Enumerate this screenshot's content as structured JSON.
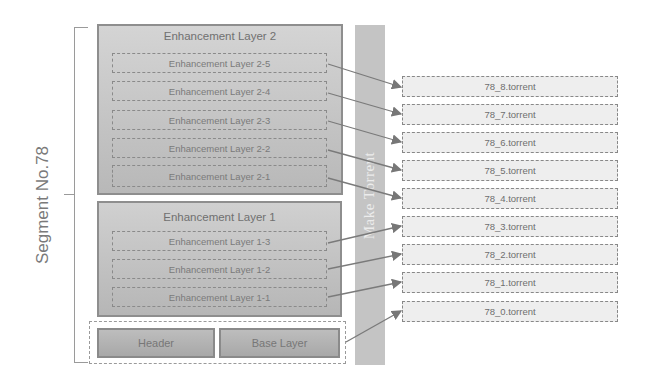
{
  "segment_label": "Segment No.78",
  "make_torrent_label": "Make Torrent",
  "enhancement_layer_2": {
    "title": "Enhancement Layer 2",
    "sublayers": [
      "Enhancement Layer 2-5",
      "Enhancement Layer 2-4",
      "Enhancement Layer 2-3",
      "Enhancement Layer 2-2",
      "Enhancement Layer 2-1"
    ]
  },
  "enhancement_layer_1": {
    "title": "Enhancement Layer 1",
    "sublayers": [
      "Enhancement Layer 1-3",
      "Enhancement Layer 1-2",
      "Enhancement Layer 1-1"
    ]
  },
  "base": {
    "header": "Header",
    "base_layer": "Base Layer"
  },
  "torrents": [
    "78_8.torrent",
    "78_7.torrent",
    "78_6.torrent",
    "78_5.torrent",
    "78_4.torrent",
    "78_3.torrent",
    "78_2.torrent",
    "78_1.torrent",
    "78_0.torrent"
  ],
  "mapping": [
    {
      "from": "Enhancement Layer 2-5",
      "to": "78_8.torrent"
    },
    {
      "from": "Enhancement Layer 2-4",
      "to": "78_7.torrent"
    },
    {
      "from": "Enhancement Layer 2-3",
      "to": "78_6.torrent"
    },
    {
      "from": "Enhancement Layer 2-2",
      "to": "78_5.torrent"
    },
    {
      "from": "Enhancement Layer 2-1",
      "to": "78_4.torrent"
    },
    {
      "from": "Enhancement Layer 1-3",
      "to": "78_3.torrent"
    },
    {
      "from": "Enhancement Layer 1-2",
      "to": "78_2.torrent"
    },
    {
      "from": "Enhancement Layer 1-1",
      "to": "78_1.torrent"
    },
    {
      "from": "Header + Base Layer",
      "to": "78_0.torrent"
    }
  ]
}
